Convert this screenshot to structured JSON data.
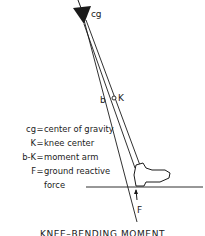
{
  "diagram": {
    "labels": {
      "cg": "cg",
      "b": "b",
      "K": "K",
      "F": "F"
    },
    "legend": [
      {
        "key": "cg",
        "value": "center of gravity"
      },
      {
        "key": "K",
        "value": "knee center"
      },
      {
        "key": "b-K",
        "value": "moment arm"
      },
      {
        "key": "F",
        "value": "ground reactive"
      },
      {
        "key": "",
        "value": "force"
      }
    ],
    "caption": "KNEE–BENDING MOMENT",
    "colors": {
      "line": "#1a1a1a",
      "background": "#ffffff"
    }
  }
}
